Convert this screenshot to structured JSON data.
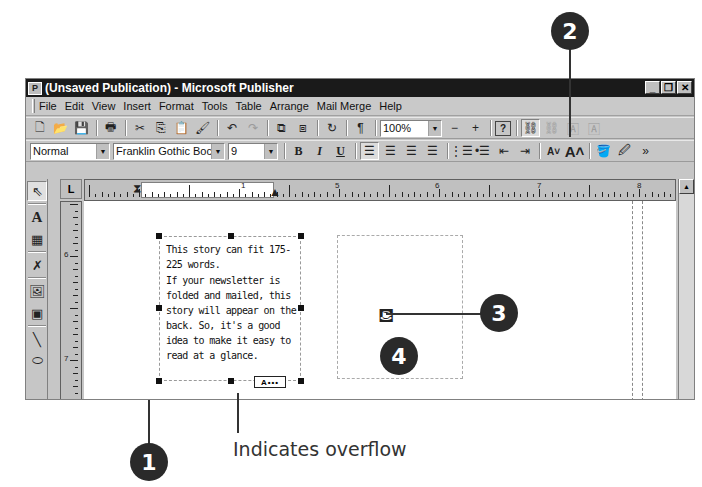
{
  "window": {
    "title": "(Unsaved Publication) - Microsoft Publisher",
    "controls": {
      "minimize": "_",
      "restore": "❐",
      "close": "✕"
    }
  },
  "menubar": {
    "items": [
      {
        "label": "File"
      },
      {
        "label": "Edit"
      },
      {
        "label": "View"
      },
      {
        "label": "Insert"
      },
      {
        "label": "Format"
      },
      {
        "label": "Tools"
      },
      {
        "label": "Table"
      },
      {
        "label": "Arrange"
      },
      {
        "label": "Mail Merge"
      },
      {
        "label": "Help"
      }
    ]
  },
  "standard_toolbar": {
    "zoom_value": "100%",
    "zoom_out": "−",
    "zoom_in": "+",
    "help": "?",
    "pilcrow": "¶"
  },
  "formatting_toolbar": {
    "style": "Normal",
    "font": "Franklin Gothic Boc",
    "size": "9",
    "bold": "B",
    "italic": "I",
    "underline": "U",
    "more": "»"
  },
  "ruler": {
    "corner": "L",
    "horizontal_labels": [
      "1",
      "5",
      "6",
      "7",
      "8"
    ],
    "vertical_labels": [
      "6",
      "7"
    ]
  },
  "document": {
    "story_paragraphs": [
      "This story can fit 175-225 words.",
      "If your newsletter is folded and mailed, this story will appear on the back. So, it's a good idea to make it easy to read at a glance."
    ],
    "overflow_indicator": "A•••"
  },
  "callouts": {
    "one": "1",
    "two": "2",
    "three": "3",
    "four": "4",
    "overflow_caption": "Indicates overflow"
  },
  "colors": {
    "titlebar": "#1a1a1a",
    "chrome": "#c6c6c6",
    "callout": "#2a2a2a"
  }
}
